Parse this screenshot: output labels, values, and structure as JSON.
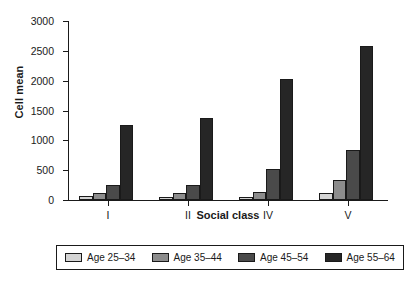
{
  "chart_data": {
    "type": "bar",
    "title": "",
    "xlabel": "Social class",
    "ylabel": "Cell mean",
    "categories": [
      "I",
      "II",
      "IV",
      "V"
    ],
    "series": [
      {
        "name": "Age 25–34",
        "color": "#d4d4d4",
        "values": [
          60,
          55,
          55,
          120
        ]
      },
      {
        "name": "Age 35–44",
        "color": "#8c8c8c",
        "values": [
          120,
          125,
          140,
          330
        ]
      },
      {
        "name": "Age 45–54",
        "color": "#4a4a4a",
        "values": [
          255,
          260,
          520,
          840
        ]
      },
      {
        "name": "Age 55–64",
        "color": "#262626",
        "values": [
          1250,
          1375,
          2020,
          2580
        ]
      }
    ],
    "ylim": [
      0,
      3000
    ],
    "yticks": [
      0,
      500,
      1000,
      1500,
      2000,
      2500,
      3000
    ],
    "ytick_labels": [
      "0",
      "500",
      "1000",
      "1500",
      "2000",
      "2500",
      "3000"
    ],
    "grid": false,
    "legend_position": "bottom"
  }
}
